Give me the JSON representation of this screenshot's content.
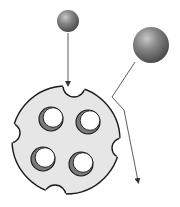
{
  "diagram": {
    "colors": {
      "background": "#ffffff",
      "disk_fill": "#e6e6e6",
      "disk_stroke": "#1a1a1a",
      "hole_inner_shadow": "#7a7a7a",
      "hole_fill": "#ffffff",
      "sphere_light": "#bdbdbd",
      "sphere_mid": "#7d7d7d",
      "sphere_dark": "#4a4a4a",
      "arrow": "#333333"
    },
    "small_sphere": {
      "cx": 68,
      "cy": 21,
      "r": 11
    },
    "large_sphere": {
      "cx": 151,
      "cy": 45,
      "r": 18
    },
    "disk": {
      "cx": 66,
      "cy": 140,
      "r": 54
    },
    "holes": [
      {
        "name": "top-left",
        "cx": 51,
        "cy": 119,
        "r": 12
      },
      {
        "name": "top-right",
        "cx": 88,
        "cy": 122,
        "r": 12
      },
      {
        "name": "bottom-left",
        "cx": 43,
        "cy": 159,
        "r": 12
      },
      {
        "name": "bottom-right",
        "cx": 81,
        "cy": 164,
        "r": 12
      }
    ],
    "notches": [
      {
        "name": "top",
        "cx": 74,
        "cy": 86,
        "r": 11
      },
      {
        "name": "left",
        "cx": 10,
        "cy": 133,
        "r": 10
      },
      {
        "name": "right",
        "cx": 122,
        "cy": 148,
        "r": 10
      },
      {
        "name": "bottom",
        "cx": 55,
        "cy": 196,
        "r": 11
      }
    ],
    "arrows": [
      {
        "name": "small-sphere-path",
        "points": "68,33 68,84"
      },
      {
        "name": "large-sphere-path",
        "points": "135,62 112,97 124,110 138,181"
      }
    ]
  }
}
